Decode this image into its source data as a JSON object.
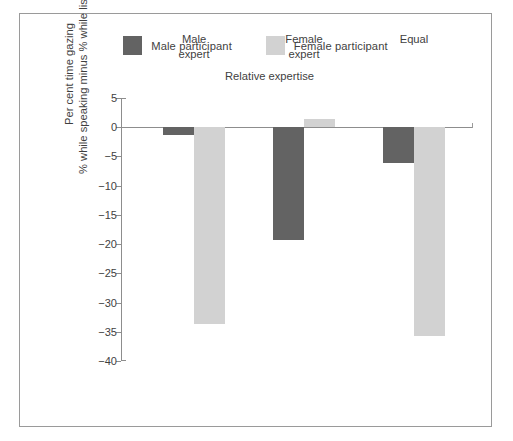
{
  "colors": {
    "male": "#636363",
    "female": "#d2d2d2",
    "axis": "#8d8d8d",
    "text": "#3f3f3f",
    "frame": "#9a9a9a"
  },
  "legend": {
    "items": [
      {
        "label": "Male participant",
        "color": "#636363",
        "swatch_name": "male-swatch"
      },
      {
        "label": "Female participant",
        "color": "#d2d2d2",
        "swatch_name": "female-swatch"
      }
    ]
  },
  "axis": {
    "group_axis_title": "Relative expertise",
    "y_caption_line1": "Per cent time gazing",
    "y_caption_line2": "% while speaking minus % while listening",
    "y_ticks": [
      "5",
      "0",
      "−5",
      "−10",
      "−15",
      "−20",
      "−25",
      "−30",
      "−35",
      "−40"
    ]
  },
  "chart_data": {
    "type": "bar",
    "title": "",
    "xlabel": "Relative expertise",
    "ylabel": "Per cent time gazing % while speaking minus % while listening",
    "categories": [
      "Male expert",
      "Female expert",
      "Equal"
    ],
    "category_lines": [
      [
        "Male",
        "expert"
      ],
      [
        "Female",
        "expert"
      ],
      [
        "Equal"
      ]
    ],
    "series": [
      {
        "name": "Male participant",
        "color": "#636363",
        "values": [
          -1.4,
          -19.3,
          -6.1
        ]
      },
      {
        "name": "Female participant",
        "color": "#d2d2d2",
        "values": [
          -33.7,
          1.4,
          -35.7
        ]
      }
    ],
    "ylim": [
      -40,
      5
    ],
    "ytick_values": [
      5,
      0,
      -5,
      -10,
      -15,
      -20,
      -25,
      -30,
      -35,
      -40
    ],
    "grid": false,
    "legend_position": "top"
  }
}
